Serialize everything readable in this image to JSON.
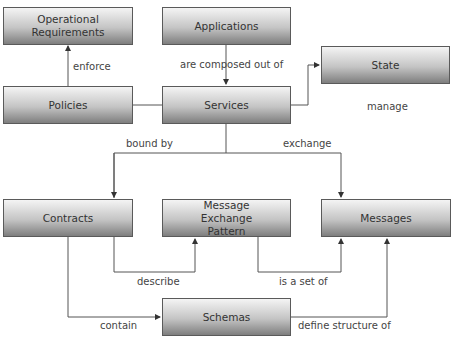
{
  "nodes": {
    "opreq": {
      "label": "Operational Requirements"
    },
    "applications": {
      "label": "Applications"
    },
    "state": {
      "label": "State"
    },
    "policies": {
      "label": "Policies"
    },
    "services": {
      "label": "Services"
    },
    "contracts": {
      "label": "Contracts"
    },
    "mep": {
      "label": "Message Exchange Pattern"
    },
    "messages": {
      "label": "Messages"
    },
    "schemas": {
      "label": "Schemas"
    }
  },
  "edges": {
    "enforce": "enforce",
    "composed": "are composed out of",
    "manage": "manage",
    "bound": "bound by",
    "exchange": "exchange",
    "describe": "describe",
    "setof": "is a set of",
    "contain": "contain",
    "define": "define structure of"
  },
  "colors": {
    "line": "#555555",
    "border": "#5a5a5a"
  }
}
